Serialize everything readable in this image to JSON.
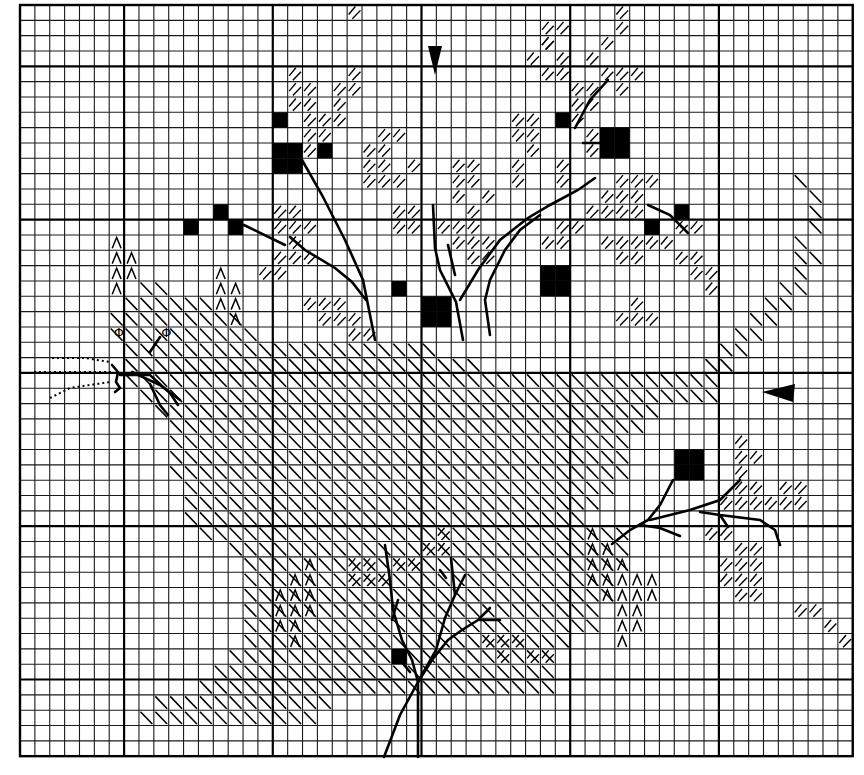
{
  "chart_title": "Cross-stitch chart: cat under a tree with berries",
  "grid": {
    "cols": 56,
    "rows": 49,
    "origin_x": 20,
    "origin_y": 5,
    "cell_w": 14.87,
    "cell_h": 15.33,
    "major_every": 10,
    "major_col_offset": 7,
    "major_row_offset": 4
  },
  "legend_symbols": {
    "solid": "black filled square (full stitch, dark)",
    "diagonal": "single diagonal backslash (cat body)",
    "hatch": "double forward hatch (foliage)",
    "chevron": "caret ^ symbol (cat markings)",
    "phi": "Φ symbol (eyes)"
  },
  "center_markers": {
    "top_arrow": {
      "col": 27.5,
      "direction": "down"
    },
    "right_arrow": {
      "row": 24.6,
      "direction": "left"
    }
  },
  "cells": {
    "solid": [
      [
        17,
        7
      ],
      [
        17,
        9
      ],
      [
        18,
        9
      ],
      [
        17,
        10
      ],
      [
        18,
        10
      ],
      [
        20,
        9
      ],
      [
        11,
        14
      ],
      [
        13,
        13
      ],
      [
        14,
        14
      ],
      [
        25,
        18
      ],
      [
        27,
        19
      ],
      [
        28,
        19
      ],
      [
        27,
        20
      ],
      [
        28,
        20
      ],
      [
        35,
        17
      ],
      [
        36,
        17
      ],
      [
        35,
        18
      ],
      [
        36,
        18
      ],
      [
        36,
        7
      ],
      [
        39,
        8
      ],
      [
        40,
        8
      ],
      [
        39,
        9
      ],
      [
        40,
        9
      ],
      [
        44,
        13
      ],
      [
        42,
        14
      ],
      [
        44,
        29
      ],
      [
        45,
        29
      ],
      [
        44,
        30
      ],
      [
        45,
        30
      ],
      [
        25,
        42
      ]
    ],
    "hatch": [
      [
        18,
        4
      ],
      [
        18,
        5
      ],
      [
        19,
        5
      ],
      [
        18,
        6
      ],
      [
        19,
        6
      ],
      [
        19,
        7
      ],
      [
        19,
        8
      ],
      [
        21,
        5
      ],
      [
        22,
        4
      ],
      [
        22,
        5
      ],
      [
        21,
        6
      ],
      [
        20,
        7
      ],
      [
        21,
        7
      ],
      [
        20,
        8
      ],
      [
        19,
        9
      ],
      [
        17,
        13
      ],
      [
        18,
        13
      ],
      [
        17,
        14
      ],
      [
        18,
        14
      ],
      [
        19,
        14
      ],
      [
        18,
        15
      ],
      [
        17,
        16
      ],
      [
        18,
        16
      ],
      [
        16,
        17
      ],
      [
        17,
        17
      ],
      [
        19,
        16
      ],
      [
        24,
        8
      ],
      [
        25,
        8
      ],
      [
        23,
        9
      ],
      [
        24,
        9
      ],
      [
        23,
        10
      ],
      [
        24,
        10
      ],
      [
        23,
        11
      ],
      [
        24,
        11
      ],
      [
        26,
        10
      ],
      [
        25,
        11
      ],
      [
        29,
        10
      ],
      [
        30,
        10
      ],
      [
        29,
        11
      ],
      [
        30,
        11
      ],
      [
        29,
        12
      ],
      [
        31,
        12
      ],
      [
        30,
        13
      ],
      [
        28,
        14
      ],
      [
        29,
        14
      ],
      [
        30,
        14
      ],
      [
        29,
        15
      ],
      [
        30,
        15
      ],
      [
        31,
        15
      ],
      [
        30,
        16
      ],
      [
        31,
        16
      ],
      [
        25,
        13
      ],
      [
        26,
        13
      ],
      [
        25,
        14
      ],
      [
        26,
        14
      ],
      [
        19,
        19
      ],
      [
        20,
        19
      ],
      [
        21,
        19
      ],
      [
        20,
        20
      ],
      [
        21,
        20
      ],
      [
        22,
        20
      ],
      [
        35,
        1
      ],
      [
        36,
        1
      ],
      [
        35,
        2
      ],
      [
        34,
        3
      ],
      [
        36,
        3
      ],
      [
        35,
        4
      ],
      [
        36,
        4
      ],
      [
        33,
        7
      ],
      [
        34,
        7
      ],
      [
        33,
        8
      ],
      [
        34,
        8
      ],
      [
        34,
        9
      ],
      [
        33,
        10
      ],
      [
        33,
        11
      ],
      [
        36,
        7
      ],
      [
        37,
        7
      ],
      [
        35,
        2
      ],
      [
        37,
        5
      ],
      [
        38,
        5
      ],
      [
        38,
        6
      ],
      [
        37,
        6
      ],
      [
        39,
        4
      ],
      [
        40,
        4
      ],
      [
        41,
        4
      ],
      [
        40,
        5
      ],
      [
        38,
        3
      ],
      [
        39,
        2
      ],
      [
        40,
        1
      ],
      [
        40,
        0
      ],
      [
        38,
        8
      ],
      [
        38,
        9
      ],
      [
        36,
        10
      ],
      [
        36,
        11
      ],
      [
        40,
        11
      ],
      [
        41,
        11
      ],
      [
        42,
        11
      ],
      [
        39,
        12
      ],
      [
        40,
        12
      ],
      [
        41,
        12
      ],
      [
        38,
        13
      ],
      [
        39,
        13
      ],
      [
        40,
        13
      ],
      [
        41,
        13
      ],
      [
        36,
        14
      ],
      [
        37,
        14
      ],
      [
        39,
        15
      ],
      [
        40,
        15
      ],
      [
        41,
        15
      ],
      [
        40,
        16
      ],
      [
        41,
        16
      ],
      [
        35,
        15
      ],
      [
        36,
        15
      ],
      [
        44,
        16
      ],
      [
        45,
        16
      ],
      [
        45,
        17
      ],
      [
        46,
        17
      ],
      [
        46,
        18
      ],
      [
        44,
        14
      ],
      [
        45,
        14
      ],
      [
        42,
        15
      ],
      [
        43,
        15
      ],
      [
        22,
        21
      ],
      [
        23,
        21
      ],
      [
        22,
        0
      ],
      [
        40,
        20
      ],
      [
        41,
        20
      ],
      [
        42,
        20
      ],
      [
        41,
        19
      ],
      [
        22,
        36
      ],
      [
        23,
        36
      ],
      [
        22,
        37
      ],
      [
        23,
        37
      ],
      [
        24,
        37
      ],
      [
        25,
        36
      ],
      [
        26,
        36
      ],
      [
        27,
        35
      ],
      [
        28,
        35
      ],
      [
        28,
        34
      ],
      [
        31,
        41
      ],
      [
        32,
        41
      ],
      [
        33,
        41
      ],
      [
        34,
        42
      ],
      [
        35,
        42
      ],
      [
        32,
        42
      ],
      [
        52,
        39
      ],
      [
        53,
        39
      ],
      [
        55,
        41
      ],
      [
        54,
        40
      ],
      [
        48,
        28
      ],
      [
        48,
        29
      ],
      [
        49,
        29
      ],
      [
        48,
        30
      ],
      [
        48,
        31
      ],
      [
        49,
        31
      ],
      [
        47,
        32
      ],
      [
        48,
        32
      ],
      [
        49,
        32
      ],
      [
        51,
        31
      ],
      [
        52,
        31
      ],
      [
        50,
        32
      ],
      [
        51,
        32
      ],
      [
        52,
        32
      ],
      [
        48,
        35
      ],
      [
        49,
        35
      ],
      [
        48,
        36
      ],
      [
        49,
        36
      ],
      [
        49,
        37
      ],
      [
        48,
        37
      ],
      [
        49,
        38
      ],
      [
        47,
        37
      ],
      [
        46,
        34
      ],
      [
        47,
        34
      ],
      [
        47,
        36
      ],
      [
        48,
        38
      ]
    ],
    "chevron": [
      [
        6,
        15
      ],
      [
        6,
        16
      ],
      [
        7,
        16
      ],
      [
        6,
        17
      ],
      [
        7,
        17
      ],
      [
        6,
        18
      ],
      [
        13,
        17
      ],
      [
        13,
        18
      ],
      [
        14,
        18
      ],
      [
        13,
        19
      ],
      [
        14,
        19
      ],
      [
        14,
        20
      ],
      [
        38,
        34
      ],
      [
        38,
        35
      ],
      [
        39,
        35
      ],
      [
        38,
        36
      ],
      [
        39,
        36
      ],
      [
        40,
        36
      ],
      [
        38,
        37
      ],
      [
        39,
        37
      ],
      [
        40,
        37
      ],
      [
        41,
        37
      ],
      [
        42,
        37
      ],
      [
        39,
        38
      ],
      [
        40,
        38
      ],
      [
        41,
        38
      ],
      [
        42,
        38
      ],
      [
        40,
        39
      ],
      [
        41,
        39
      ],
      [
        40,
        40
      ],
      [
        41,
        40
      ],
      [
        40,
        41
      ],
      [
        19,
        36
      ],
      [
        18,
        37
      ],
      [
        19,
        37
      ],
      [
        17,
        38
      ],
      [
        18,
        38
      ],
      [
        19,
        38
      ],
      [
        17,
        39
      ],
      [
        18,
        39
      ],
      [
        19,
        39
      ],
      [
        17,
        40
      ],
      [
        18,
        40
      ],
      [
        18,
        41
      ]
    ],
    "diag_rows": [
      {
        "row": 18,
        "from": 8,
        "to": 9
      },
      {
        "row": 19,
        "from": 7,
        "to": 12
      },
      {
        "row": 20,
        "from": 6,
        "to": 14
      },
      {
        "row": 21,
        "from": 6,
        "to": 15
      },
      {
        "row": 22,
        "from": 7,
        "to": 27
      },
      {
        "row": 23,
        "from": 7,
        "to": 30
      },
      {
        "row": 24,
        "from": 7,
        "to": 46
      },
      {
        "row": 25,
        "from": 8,
        "to": 46
      },
      {
        "row": 26,
        "from": 9,
        "to": 42
      },
      {
        "row": 27,
        "from": 10,
        "to": 41
      },
      {
        "row": 28,
        "from": 10,
        "to": 40
      },
      {
        "row": 29,
        "from": 10,
        "to": 40
      },
      {
        "row": 30,
        "from": 10,
        "to": 40
      },
      {
        "row": 31,
        "from": 11,
        "to": 39
      },
      {
        "row": 32,
        "from": 11,
        "to": 38
      },
      {
        "row": 33,
        "from": 11,
        "to": 37
      },
      {
        "row": 34,
        "from": 12,
        "to": 40
      },
      {
        "row": 35,
        "from": 14,
        "to": 40
      },
      {
        "row": 36,
        "from": 15,
        "to": 40
      },
      {
        "row": 37,
        "from": 15,
        "to": 39
      },
      {
        "row": 38,
        "from": 15,
        "to": 39
      },
      {
        "row": 39,
        "from": 15,
        "to": 38
      },
      {
        "row": 40,
        "from": 15,
        "to": 38
      },
      {
        "row": 41,
        "from": 15,
        "to": 36
      },
      {
        "row": 42,
        "from": 14,
        "to": 35
      },
      {
        "row": 43,
        "from": 13,
        "to": 35
      },
      {
        "row": 44,
        "from": 12,
        "to": 35
      },
      {
        "row": 45,
        "from": 9,
        "to": 20
      },
      {
        "row": 46,
        "from": 8,
        "to": 19
      }
    ],
    "diag_tail": [
      [
        52,
        11
      ],
      [
        53,
        12
      ],
      [
        53,
        13
      ],
      [
        53,
        14
      ],
      [
        52,
        15
      ],
      [
        52,
        16
      ],
      [
        53,
        16
      ],
      [
        52,
        17
      ],
      [
        51,
        18
      ],
      [
        52,
        18
      ],
      [
        50,
        19
      ],
      [
        51,
        19
      ],
      [
        49,
        20
      ],
      [
        50,
        20
      ],
      [
        48,
        21
      ],
      [
        49,
        21
      ],
      [
        47,
        22
      ],
      [
        48,
        22
      ],
      [
        46,
        23
      ],
      [
        47,
        23
      ]
    ]
  },
  "eyes": [
    {
      "col": 6.3,
      "row": 21.3,
      "symbol": "Φ"
    },
    {
      "col": 9.5,
      "row": 21.3,
      "symbol": "Φ"
    }
  ],
  "branches": [
    "M 302 160 L 322 195 L 345 240 L 363 280 L 375 340",
    "M 244 225 L 285 245",
    "M 290 237 L 305 250 L 335 268 L 352 282 L 366 300",
    "M 433 205 L 435 248 L 440 270 L 456 302 L 463 340",
    "M 448 245 L 455 275",
    "M 460 300 L 478 270 L 500 240 L 528 218 L 550 205 L 578 190 L 595 178",
    "M 490 335 L 485 300 L 490 280 L 505 250 L 520 230 L 540 215",
    "M 575 128 L 590 100 L 608 80",
    "M 583 143 L 600 143",
    "M 648 205 L 670 215 L 688 233",
    "M 612 544 L 630 530 L 648 520 L 660 505 L 673 480",
    "M 640 525 L 660 528 L 680 536",
    "M 650 520 L 690 510 L 720 500 L 740 480",
    "M 700 512 L 720 515 L 760 520 L 775 530 L 780 545",
    "M 720 515 L 728 527",
    "M 418 757 L 418 682 L 412 660 L 402 640 L 393 610 L 390 580 L 385 545",
    "M 384 757 L 400 715 L 418 682",
    "M 418 682 L 432 660 L 448 640 L 462 630 L 478 620 L 490 608",
    "M 418 682 L 436 650 L 445 618 L 455 595 L 465 575",
    "M 455 595 L 451 558",
    "M 446 578 L 440 570",
    "M 398 600 L 392 620",
    "M 480 620 L 500 620",
    "M 410 672 L 400 660"
  ],
  "whiskers": [
    "M 120 375 L 150 375 L 170 393 L 178 405",
    "M 132 372 L 160 385 L 180 400",
    "M 150 384 L 160 405 L 168 415"
  ],
  "whiskers_dotted": [
    "M 52 358 L 85 358 L 110 362",
    "M 34 372 L 112 372",
    "M 50 398 L 70 388 L 110 382"
  ],
  "nose": "M 112 365 L 118 372 L 116 382 L 120 388 L 115 392"
}
